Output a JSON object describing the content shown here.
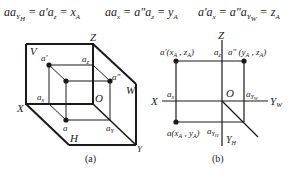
{
  "formulas": [
    {
      "lhs": "aa",
      "lhs_sub": "Y",
      "lhs_subsub": "H",
      "mid": "a'a",
      "mid_sub": "z",
      "rhs": "x",
      "rhs_sub": "A"
    },
    {
      "lhs": "aa",
      "lhs_sub": "x",
      "mid": "a\"a",
      "mid_sub": "z",
      "rhs": "y",
      "rhs_sub": "A"
    },
    {
      "lhs": "a'a",
      "lhs_sub": "x",
      "mid": "a\"a",
      "mid_sub": "Y",
      "mid_subsub": "W",
      "rhs": "z",
      "rhs_sub": "A"
    }
  ],
  "figure_a": {
    "caption": "(a)",
    "labels": {
      "Z": "Z",
      "V": "V",
      "W": "W",
      "X": "X",
      "O": "O",
      "H": "H",
      "Y": "Y",
      "a_prime": "a'",
      "a_dprime": "a\"",
      "a": "a",
      "a_z": "a",
      "a_z_sub": "z",
      "a_x": "a",
      "a_x_sub": "x",
      "a_y": "a",
      "a_y_sub": "Y"
    }
  },
  "figure_b": {
    "caption": "(b)",
    "labels": {
      "Z": "Z",
      "X": "X",
      "O": "O",
      "Y_W": "Y",
      "Y_W_sub": "W",
      "Y_H": "Y",
      "Y_H_sub": "H",
      "a_prime": "a'(x",
      "a_prime_sub1": "A",
      "a_prime_mid": " , z",
      "a_prime_sub2": "A",
      "a_prime_end": ")",
      "a_dprime": "a\" (y",
      "a_dprime_sub1": "A",
      "a_dprime_mid": " , z",
      "a_dprime_sub2": "A",
      "a_dprime_end": ")",
      "a": "a(x",
      "a_sub1": "A",
      "a_mid": " , y",
      "a_sub2": "A",
      "a_end": ")",
      "a_z": "a",
      "a_z_sub": "z",
      "a_x": "a",
      "a_x_sub": "x",
      "a_yw": "a",
      "a_yw_sub": "Y",
      "a_yw_subsub": "W",
      "a_yh": "a",
      "a_yh_sub": "Y",
      "a_yh_subsub": "H"
    }
  }
}
